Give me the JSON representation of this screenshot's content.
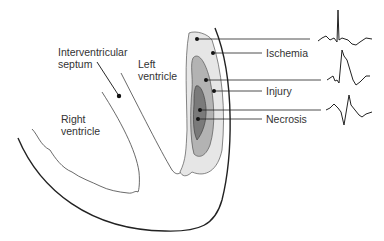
{
  "diagram": {
    "labels": {
      "interventricular_septum": [
        "Interventricular",
        "septum"
      ],
      "left_ventricle": [
        "Left",
        "ventricle"
      ],
      "right_ventricle": [
        "Right",
        "ventricle"
      ],
      "ischemia": "Ischemia",
      "injury": "Injury",
      "necrosis": "Necrosis"
    },
    "zones": [
      {
        "name": "Ischemia",
        "color": "#e6e6e6"
      },
      {
        "name": "Injury",
        "color": "#b3b3b3"
      },
      {
        "name": "Necrosis",
        "color": "#7a7a7a"
      }
    ],
    "ecg_traces": [
      {
        "zone": "Ischemia",
        "description": "tall R wave with inverted T wave"
      },
      {
        "zone": "Injury",
        "description": "ST segment elevation"
      },
      {
        "zone": "Necrosis",
        "description": "deep Q wave"
      }
    ]
  }
}
